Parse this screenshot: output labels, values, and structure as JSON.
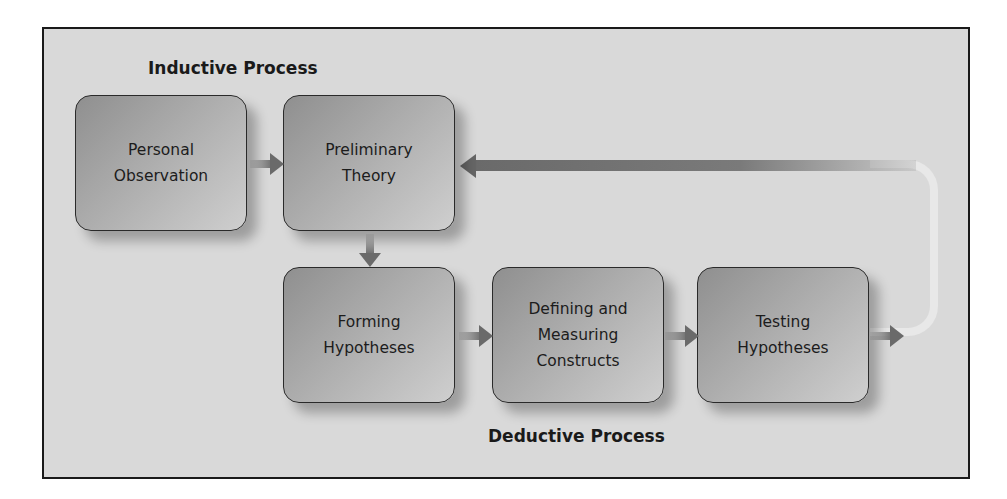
{
  "diagram": {
    "labels": {
      "inductive": "Inductive Process",
      "deductive": "Deductive Process"
    },
    "boxes": [
      {
        "id": "personal-observation",
        "lines": [
          "Personal",
          "Observation"
        ]
      },
      {
        "id": "preliminary-theory",
        "lines": [
          "Preliminary",
          "Theory"
        ]
      },
      {
        "id": "forming-hypotheses",
        "lines": [
          "Forming",
          "Hypotheses"
        ]
      },
      {
        "id": "defining-measuring-constructs",
        "lines": [
          "Defining and",
          "Measuring",
          "Constructs"
        ]
      },
      {
        "id": "testing-hypotheses",
        "lines": [
          "Testing",
          "Hypotheses"
        ]
      }
    ],
    "edges": [
      {
        "from": "personal-observation",
        "to": "preliminary-theory"
      },
      {
        "from": "preliminary-theory",
        "to": "forming-hypotheses"
      },
      {
        "from": "forming-hypotheses",
        "to": "defining-measuring-constructs"
      },
      {
        "from": "defining-measuring-constructs",
        "to": "testing-hypotheses"
      },
      {
        "from": "testing-hypotheses",
        "to": "preliminary-theory",
        "type": "feedback-loop"
      }
    ],
    "colors": {
      "frame_bg": "#d9d9d9",
      "box_dark": "#8f8f8f",
      "box_light": "#cfcfcf",
      "arrow": "#6a6a6a",
      "border": "#1a1a1a"
    }
  }
}
